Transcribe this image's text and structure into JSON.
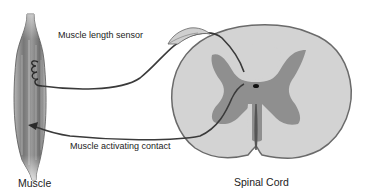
{
  "labels": {
    "sensor": "Muscle length sensor",
    "contact": "Muscle activating contact",
    "muscle": "Muscle",
    "spinal_cord": "Spinal Cord"
  },
  "colors": {
    "white_matter": "#d4d4d4",
    "white_matter_outline": "#6e6e6e",
    "gray_matter": "#8c8c8c",
    "muscle_dark": "#7a7a7a",
    "muscle_light": "#c8c8c8",
    "nerve": "#3a3a3a"
  }
}
